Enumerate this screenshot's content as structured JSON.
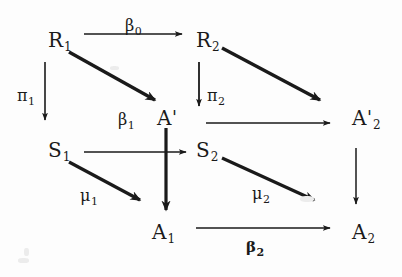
{
  "figure": {
    "kind": "commutative-diagram",
    "background_color": "#fdfdfd",
    "ink_color": "#1a1a1a"
  },
  "nodes": [
    {
      "id": "R1",
      "base": "R",
      "sub": "1",
      "prime": "",
      "x": 48,
      "y": 30
    },
    {
      "id": "R2",
      "base": "R",
      "sub": "2",
      "prime": "",
      "x": 196,
      "y": 30
    },
    {
      "id": "Aprime",
      "base": "A",
      "sub": "",
      "prime": "'",
      "x": 157,
      "y": 108
    },
    {
      "id": "A2prime",
      "base": "A",
      "sub": "2",
      "prime": "'",
      "x": 352,
      "y": 108
    },
    {
      "id": "S1",
      "base": "S",
      "sub": "1",
      "prime": "",
      "x": 48,
      "y": 140
    },
    {
      "id": "S2",
      "base": "S",
      "sub": "2",
      "prime": "",
      "x": 196,
      "y": 140
    },
    {
      "id": "A1",
      "base": "A",
      "sub": "1",
      "prime": "",
      "x": 152,
      "y": 222
    },
    {
      "id": "A2",
      "base": "A",
      "sub": "2",
      "prime": "",
      "x": 352,
      "y": 222
    }
  ],
  "arrow_labels": [
    {
      "id": "beta0",
      "base": "β",
      "sub": "0",
      "x": 125,
      "y": 18,
      "bold": false
    },
    {
      "id": "pi1",
      "base": "π",
      "sub": "1",
      "x": 17,
      "y": 88,
      "bold": false
    },
    {
      "id": "pi2",
      "base": "π",
      "sub": "2",
      "x": 207,
      "y": 88,
      "bold": false
    },
    {
      "id": "beta1",
      "base": "β",
      "sub": "1",
      "x": 118,
      "y": 112,
      "bold": false
    },
    {
      "id": "mu1",
      "base": "μ",
      "sub": "1",
      "x": 80,
      "y": 188,
      "bold": false
    },
    {
      "id": "mu2",
      "base": "μ",
      "sub": "2",
      "x": 252,
      "y": 186,
      "bold": false
    },
    {
      "id": "beta2",
      "base": "β",
      "sub": "2",
      "x": 246,
      "y": 240,
      "bold": true
    }
  ],
  "arrows": [
    {
      "id": "R1-to-R2",
      "from": "R1",
      "to": "R2",
      "style": "thin",
      "label": "beta0"
    },
    {
      "id": "R1-to-Aprime",
      "from": "R1",
      "to": "Aprime",
      "style": "thick",
      "label": ""
    },
    {
      "id": "R1-to-S1",
      "from": "R1",
      "to": "S1",
      "style": "thin",
      "label": "pi1"
    },
    {
      "id": "R2-to-A2prime",
      "from": "R2",
      "to": "A2prime",
      "style": "thick",
      "label": ""
    },
    {
      "id": "R2-to-S2",
      "from": "R2",
      "to": "S2",
      "style": "thin",
      "label": "pi2"
    },
    {
      "id": "Aprime-to-A2prime",
      "from": "Aprime",
      "to": "A2prime",
      "style": "thin",
      "label": ""
    },
    {
      "id": "Aprime-to-A1",
      "from": "Aprime",
      "to": "A1",
      "style": "thick",
      "label": ""
    },
    {
      "id": "S1-to-S2",
      "from": "S1",
      "to": "S2",
      "style": "thin",
      "label": "beta1"
    },
    {
      "id": "S1-to-A1",
      "from": "S1",
      "to": "A1",
      "style": "thick",
      "label": "mu1"
    },
    {
      "id": "S2-to-A2",
      "from": "S2",
      "to": "A2",
      "style": "thick",
      "label": "mu2"
    },
    {
      "id": "A2prime-to-A2",
      "from": "A2prime",
      "to": "A2",
      "style": "thin",
      "label": ""
    },
    {
      "id": "A1-to-A2",
      "from": "A1",
      "to": "A2",
      "style": "thin",
      "label": "beta2"
    }
  ]
}
